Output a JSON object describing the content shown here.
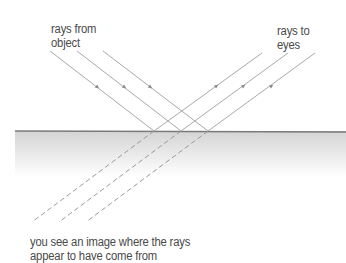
{
  "diagram": {
    "labels": {
      "rays_from_object": [
        "rays from",
        "object"
      ],
      "rays_to_eyes": [
        "rays to",
        "eyes"
      ],
      "caption": [
        "you see an image where the rays",
        "appear to have come from"
      ]
    },
    "colors": {
      "ray": "#a8a8a8",
      "arrow": "#8a8a8a",
      "mirror_line": "#7a7a7a",
      "mirror_shade_top": "#d6d6d6",
      "mirror_shade_bottom": "#ffffff",
      "text": "#4a4a4a"
    },
    "incident_rays": [
      {
        "x1": 50,
        "y1": 51,
        "x2": 154,
        "y2": 131
      },
      {
        "x1": 77,
        "y1": 51,
        "x2": 181,
        "y2": 131
      },
      {
        "x1": 103,
        "y1": 51,
        "x2": 208,
        "y2": 131
      }
    ],
    "reflected_rays": [
      {
        "x1": 154,
        "y1": 131,
        "x2": 262,
        "y2": 53
      },
      {
        "x1": 181,
        "y1": 131,
        "x2": 288,
        "y2": 53
      },
      {
        "x1": 208,
        "y1": 131,
        "x2": 315,
        "y2": 53
      }
    ],
    "virtual_rays": [
      {
        "x1": 154,
        "y1": 131,
        "x2": 32,
        "y2": 222
      },
      {
        "x1": 181,
        "y1": 131,
        "x2": 59,
        "y2": 222
      },
      {
        "x1": 208,
        "y1": 131,
        "x2": 86,
        "y2": 222
      }
    ],
    "mirror": {
      "x1": 15,
      "x2": 346,
      "y": 131,
      "shade_height": 45
    }
  }
}
